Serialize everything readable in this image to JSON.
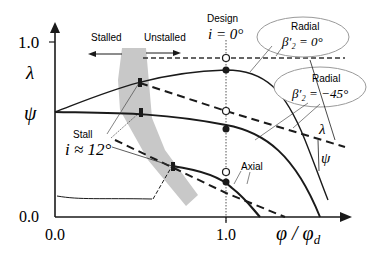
{
  "axes": {
    "y_ticks": [
      {
        "label": "1.0",
        "y": 42
      },
      {
        "label": "λ",
        "y": 72
      },
      {
        "label": "ψ",
        "y": 112
      },
      {
        "label": "0.0",
        "y": 217
      }
    ],
    "x_ticks": [
      {
        "label": "0.0",
        "x": 55
      },
      {
        "label": "1.0",
        "x": 226
      }
    ],
    "x_label_main": "φ / φ",
    "x_label_sub": "d"
  },
  "labels": {
    "stalled": "Stalled",
    "unstalled": "Unstalled",
    "design": "Design",
    "design_incidence": "i = 0°",
    "stall": "Stall",
    "stall_incidence": "i ≈ 12°",
    "radial0_title": "Radial",
    "radial0_value": "β′₂ = 0°",
    "radial45_title": "Radial",
    "radial45_value": "β′₂ = −45°",
    "axial": "Axial",
    "lambda": "λ",
    "psi": "ψ"
  },
  "colors": {
    "stall_band": "#c8c8c8",
    "line": "#1a1a1a",
    "ellipse_stroke": "#9a9a9a"
  }
}
